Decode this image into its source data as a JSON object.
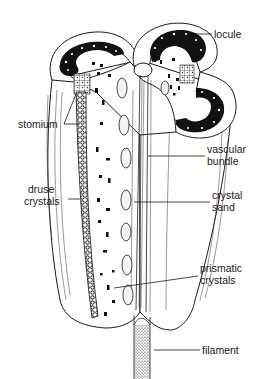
{
  "figure": {
    "labels": {
      "locule": "locule",
      "stomium": "stomium",
      "druse_crystals": [
        "druse",
        "crystals"
      ],
      "vascular_bundle": [
        "vascular",
        "bundle"
      ],
      "crystal_sand": [
        "crystal",
        "sand"
      ],
      "prismatic_crystals": [
        "prismatic",
        "crystals"
      ],
      "filament": "filament"
    }
  }
}
